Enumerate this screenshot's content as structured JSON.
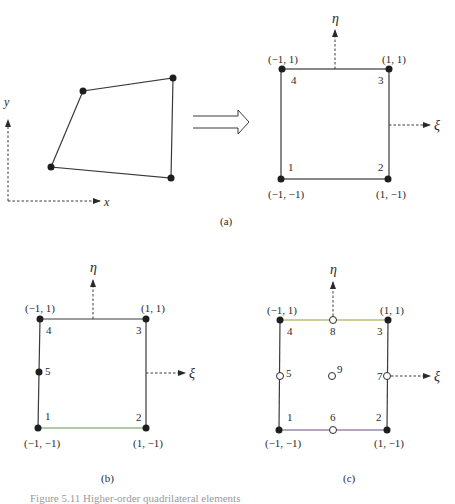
{
  "figure": {
    "caption": "Figure 5.11   Higher-order quadrilateral elements",
    "panels": {
      "a": {
        "label": "(a)",
        "physical_axes": {
          "x": "x",
          "y": "y"
        },
        "mapping_arrow": "hollow-double-arrow",
        "parent": {
          "eta": "η",
          "xi": "ξ",
          "nodes": [
            {
              "id": "1",
              "coord": "(−1, −1)"
            },
            {
              "id": "2",
              "coord": "(1, −1)"
            },
            {
              "id": "3",
              "coord": "(1, 1)"
            },
            {
              "id": "4",
              "coord": "(−1, 1)"
            }
          ]
        }
      },
      "b": {
        "label": "(b)",
        "eta": "η",
        "xi": "ξ",
        "nodes": [
          {
            "id": "1",
            "coord": "(−1, −1)"
          },
          {
            "id": "2",
            "coord": "(1, −1)"
          },
          {
            "id": "3",
            "coord": "(1, 1)"
          },
          {
            "id": "4",
            "coord": "(−1, 1)"
          },
          {
            "id": "5",
            "coord": ""
          }
        ],
        "edge_colors": {
          "bottom": "#5a9a4a"
        }
      },
      "c": {
        "label": "(c)",
        "eta": "η",
        "xi": "ξ",
        "nodes": [
          {
            "id": "1",
            "coord": "(−1, −1)"
          },
          {
            "id": "2",
            "coord": "(1, −1)"
          },
          {
            "id": "3",
            "coord": "(1, 1)"
          },
          {
            "id": "4",
            "coord": "(−1, 1)"
          },
          {
            "id": "5",
            "coord": ""
          },
          {
            "id": "6",
            "coord": ""
          },
          {
            "id": "7",
            "coord": ""
          },
          {
            "id": "8",
            "coord": ""
          },
          {
            "id": "9",
            "coord": ""
          }
        ],
        "edge_colors": {
          "top": "#9a9a3a",
          "bottom": "#6a4a7a"
        }
      }
    }
  }
}
